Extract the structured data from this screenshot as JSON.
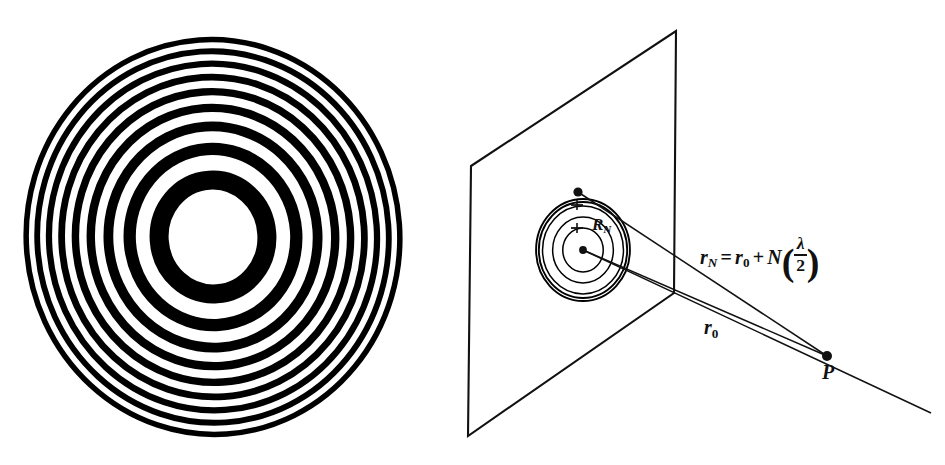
{
  "figure": {
    "background_color": "#ffffff",
    "ink_color": "#000000",
    "width": 945,
    "height": 465
  },
  "panels": [
    {
      "id": "zone-plate",
      "name": "fresnel-zone-plate",
      "caption": "",
      "description": "Concentric alternating black and transparent annular zones"
    },
    {
      "id": "geometry",
      "name": "zone-plate-geometry",
      "caption": "",
      "description": "Tilted plane containing concentric zone circles with rays converging on point P"
    }
  ],
  "labels": {
    "r_N": "r",
    "r_N_sub": "N",
    "equals": "=",
    "r_0": "r",
    "r_0_sub": "0",
    "plus": "+",
    "N": "N",
    "lambda": "λ",
    "two": "2",
    "r0_label": "r",
    "r0_label_sub": "0",
    "point_P": "P",
    "R_N": "R",
    "R_N_sub": "N",
    "formula_plain": "r_N = r_0 + N(λ/2)"
  },
  "chart_data": {
    "type": "diagram",
    "zone_plate": {
      "center_x": 213,
      "center_y": 237,
      "radius_x": 192,
      "radius_y": 203,
      "rotation_deg": -4,
      "zone_count": 11,
      "first_zone_is_open": true,
      "comment": "Zone boundary radii scale as sqrt(N); inner zone open (white), alternating opaque rings",
      "normalized_boundaries": [
        0.2325,
        0.3288,
        0.4027,
        0.465,
        0.5199,
        0.5695,
        0.6151,
        0.6576,
        0.6975,
        0.7352,
        0.7711,
        0.8054,
        0.8383,
        0.87,
        0.9006,
        0.9302,
        0.9589,
        0.9868,
        1.0
      ]
    },
    "geometry": {
      "plane_corners": [
        [
          471,
          166
        ],
        [
          676,
          31
        ],
        [
          674,
          293
        ],
        [
          468,
          436
        ]
      ],
      "zone_center": [
        583,
        250
      ],
      "zone_circle_radii": [
        22,
        33,
        44,
        48
      ],
      "aperture_edge_point": [
        578,
        192
      ],
      "focus_point": [
        827,
        356
      ],
      "ray_tail_end": [
        931,
        413
      ]
    }
  }
}
